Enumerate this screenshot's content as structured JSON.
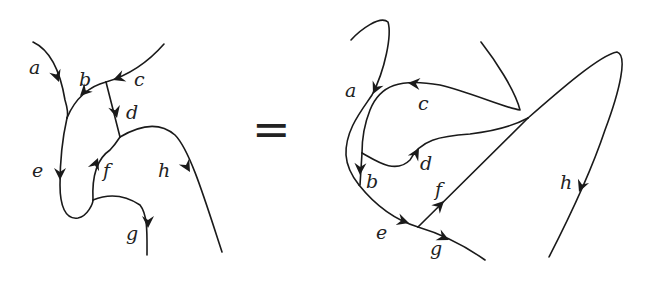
{
  "diagram": {
    "type": "string-diagram-equation",
    "relation": "=",
    "left": {
      "labels": {
        "a": "a",
        "b": "b",
        "c": "c",
        "d": "d",
        "e": "e",
        "f": "f",
        "g": "g",
        "h": "h"
      }
    },
    "right": {
      "labels": {
        "a": "a",
        "b": "b",
        "c": "c",
        "d": "d",
        "e": "e",
        "f": "f",
        "g": "g",
        "h": "h"
      }
    },
    "colors": {
      "stroke": "#1a1a1a",
      "background": "#ffffff"
    }
  }
}
